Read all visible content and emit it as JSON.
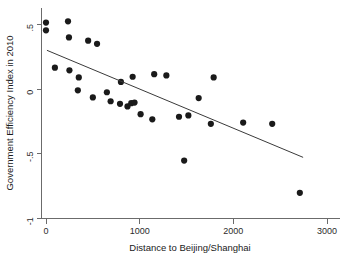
{
  "chart_data": {
    "type": "scatter",
    "title": "",
    "xlabel": "Distance to Beijing/Shanghai",
    "ylabel": "Government Efficiency Index in 2010",
    "xlim": [
      -80,
      3150
    ],
    "ylim": [
      -1.05,
      0.57
    ],
    "grid": false,
    "legend": null,
    "xticks": [
      0,
      1000,
      2000,
      3000
    ],
    "xtick_labels": [
      "0",
      "1000",
      "2000",
      "3000"
    ],
    "yticks": [
      0.5,
      0,
      -0.5,
      -1
    ],
    "ytick_labels": [
      ".5",
      "0",
      "-.5",
      "-1"
    ],
    "marker": {
      "shape": "circle",
      "color": "#1a1a1a",
      "size": 3.1
    },
    "points": [
      {
        "x": 0,
        "y": 0.515
      },
      {
        "x": 0,
        "y": 0.455
      },
      {
        "x": 235,
        "y": 0.525
      },
      {
        "x": 245,
        "y": 0.4
      },
      {
        "x": 450,
        "y": 0.375
      },
      {
        "x": 545,
        "y": 0.35
      },
      {
        "x": 95,
        "y": 0.165
      },
      {
        "x": 250,
        "y": 0.145
      },
      {
        "x": 350,
        "y": 0.09
      },
      {
        "x": 800,
        "y": 0.055
      },
      {
        "x": 925,
        "y": 0.095
      },
      {
        "x": 1155,
        "y": 0.115
      },
      {
        "x": 1285,
        "y": 0.105
      },
      {
        "x": 1790,
        "y": 0.09
      },
      {
        "x": 340,
        "y": -0.01
      },
      {
        "x": 650,
        "y": -0.025
      },
      {
        "x": 500,
        "y": -0.065
      },
      {
        "x": 690,
        "y": -0.095
      },
      {
        "x": 790,
        "y": -0.115
      },
      {
        "x": 870,
        "y": -0.135
      },
      {
        "x": 910,
        "y": -0.11
      },
      {
        "x": 945,
        "y": -0.105
      },
      {
        "x": 1630,
        "y": -0.07
      },
      {
        "x": 1010,
        "y": -0.195
      },
      {
        "x": 1135,
        "y": -0.235
      },
      {
        "x": 1420,
        "y": -0.215
      },
      {
        "x": 1520,
        "y": -0.205
      },
      {
        "x": 1760,
        "y": -0.27
      },
      {
        "x": 2105,
        "y": -0.26
      },
      {
        "x": 2415,
        "y": -0.27
      },
      {
        "x": 1475,
        "y": -0.555
      },
      {
        "x": 2710,
        "y": -0.805
      }
    ],
    "fit_line": {
      "x_start": 10,
      "y_start": 0.3,
      "x_end": 2745,
      "y_end": -0.53
    }
  },
  "axes": {
    "x_axis_name": "x-axis",
    "y_axis_name": "y-axis"
  }
}
